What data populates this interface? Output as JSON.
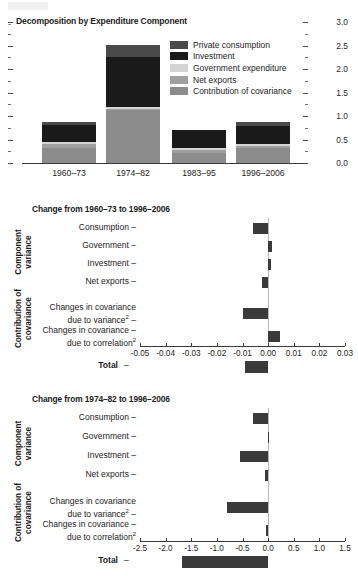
{
  "figure": {
    "panels": [
      "decomposition-stacked-bar",
      "change-1960-73-to-1996-2006",
      "change-1974-82-to-1996-2006"
    ]
  },
  "colors": {
    "private_consumption": "#4a4a4a",
    "investment": "#1a1a1a",
    "government_expenditure": "#d4d4d4",
    "net_exports": "#a0a0a0",
    "contribution_of_covariance": "#8c8c8c",
    "bar_dark": "#3a3a3a",
    "axis": "#3a3a3a",
    "zero_line": "#b9b9b9",
    "background": "#ffffff"
  },
  "panel1": {
    "title": "Decomposition by Expenditure Component",
    "leading_dash": "-",
    "legend": [
      {
        "label": "Private consumption",
        "color": "#4a4a4a"
      },
      {
        "label": "Investment",
        "color": "#1a1a1a"
      },
      {
        "label": "Government expenditure",
        "color": "#d4d4d4"
      },
      {
        "label": "Net exports",
        "color": "#a0a0a0"
      },
      {
        "label": "Contribution of covariance",
        "color": "#8c8c8c"
      }
    ]
  },
  "panel2": {
    "title": "Change from 1960–73 to 1996–2006"
  },
  "panel3": {
    "title": "Change from 1974–82 to 1996–2006"
  },
  "group_labels": {
    "component_variance": "Component\nvariance",
    "component_variance_l1": "Component",
    "component_variance_l2": "variance",
    "contribution_l1": "Contribution of",
    "contribution_l2": "covariance"
  },
  "category_labels": {
    "consumption": "Consumption",
    "government": "Government",
    "investment": "Investment",
    "net_exports": "Net exports",
    "cov_variance_l1": "Changes in covariance",
    "cov_variance_l2": "due to variance",
    "cov_correlation_l1": "Changes in covariance",
    "cov_correlation_l2": "due to correlation",
    "superscript": "2",
    "total": "Total",
    "tick_dash": "–"
  },
  "chart_data": [
    {
      "type": "bar",
      "id": "decomposition-by-expenditure-component",
      "title": "Decomposition by Expenditure Component",
      "stacked": true,
      "xlabel": "",
      "ylabel": "",
      "categories": [
        "1960–73",
        "1974–82",
        "1983–95",
        "1996–2006"
      ],
      "ylim": [
        0.0,
        3.0
      ],
      "yticks": [
        0.0,
        0.5,
        1.0,
        1.5,
        2.0,
        2.5,
        3.0
      ],
      "ytick_labels": [
        "0.0",
        "0.5",
        "1.0",
        "1.5",
        "2.0",
        "2.5",
        "3.0"
      ],
      "yminor_step": 0.25,
      "grid": false,
      "legend_position": "upper-right-inside",
      "axis_side": "right",
      "series": [
        {
          "name": "Contribution of covariance",
          "color": "#8c8c8c",
          "values": [
            0.33,
            1.14,
            0.22,
            0.33
          ]
        },
        {
          "name": "Net exports",
          "color": "#a0a0a0",
          "values": [
            0.07,
            0.01,
            0.06,
            0.04
          ]
        },
        {
          "name": "Government expenditure",
          "color": "#d4d4d4",
          "values": [
            0.04,
            0.05,
            0.03,
            0.04
          ]
        },
        {
          "name": "Investment",
          "color": "#1a1a1a",
          "values": [
            0.36,
            1.05,
            0.39,
            0.37
          ]
        },
        {
          "name": "Private consumption",
          "color": "#4a4a4a",
          "values": [
            0.08,
            0.27,
            0.0,
            0.09
          ]
        }
      ],
      "totals": [
        0.88,
        2.52,
        0.7,
        0.87
      ]
    },
    {
      "type": "bar",
      "id": "change-from-1960-73-to-1996-2006",
      "orientation": "horizontal",
      "title": "Change from 1960–73 to 1996–2006",
      "xlabel": "",
      "ylabel": "",
      "xlim": [
        -0.05,
        0.03
      ],
      "xticks": [
        -0.05,
        -0.04,
        -0.03,
        -0.02,
        -0.01,
        0.0,
        0.01,
        0.02,
        0.03
      ],
      "xtick_labels": [
        "-0.05",
        "-0.04",
        "-0.03",
        "-0.02",
        "-0.01",
        "0.00",
        "0.01",
        "0.02",
        "0.03"
      ],
      "grid": false,
      "groups": [
        {
          "name": "Component variance",
          "categories": [
            "Consumption",
            "Government",
            "Investment",
            "Net exports"
          ]
        },
        {
          "name": "Contribution of covariance",
          "categories": [
            "Changes in covariance due to variance2",
            "Changes in covariance due to correlation2"
          ]
        },
        {
          "name": "",
          "categories": [
            "Total"
          ]
        }
      ],
      "categories": [
        "Consumption",
        "Government",
        "Investment",
        "Net exports",
        "Changes in covariance due to variance²",
        "Changes in covariance due to correlation²",
        "Total"
      ],
      "values": [
        -0.006,
        0.0015,
        0.0013,
        -0.0023,
        -0.01,
        0.0045,
        -0.009
      ],
      "bar_color": "#3a3a3a"
    },
    {
      "type": "bar",
      "id": "change-from-1974-82-to-1996-2006",
      "orientation": "horizontal",
      "title": "Change from 1974–82 to 1996–2006",
      "xlabel": "",
      "ylabel": "",
      "xlim": [
        -2.5,
        1.5
      ],
      "xticks": [
        -2.5,
        -2.0,
        -1.5,
        -1.0,
        -0.5,
        0.0,
        0.5,
        1.0,
        1.5
      ],
      "xtick_labels": [
        "-2.5",
        "-2.0",
        "-1.5",
        "-1.0",
        "-0.5",
        "0.0",
        "0.5",
        "1.0",
        "1.5"
      ],
      "grid": false,
      "categories": [
        "Consumption",
        "Government",
        "Investment",
        "Net exports",
        "Changes in covariance due to variance²",
        "Changes in covariance due to correlation²",
        "Total"
      ],
      "values": [
        -0.3,
        -0.01,
        -0.55,
        -0.06,
        -0.8,
        -0.05,
        -1.68
      ],
      "bar_color": "#3a3a3a"
    }
  ]
}
